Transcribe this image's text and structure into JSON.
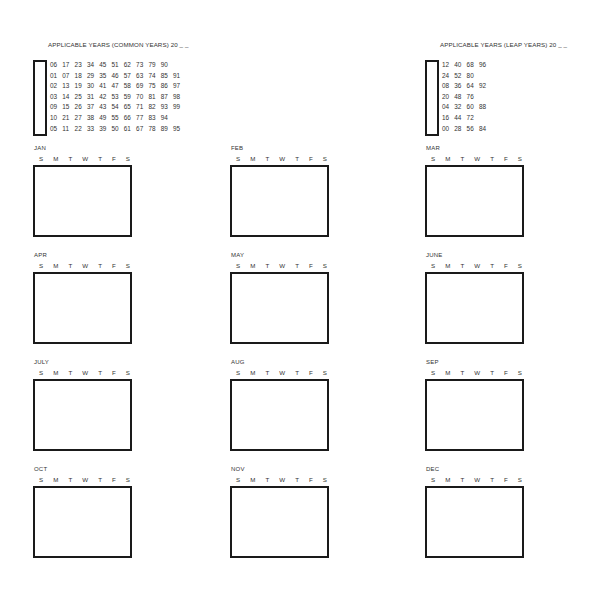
{
  "common_years": {
    "title": "APPLICABLE YEARS (COMMON YEARS) 20 _ _",
    "rows": [
      [
        "06",
        "17",
        "23",
        "34",
        "45",
        "51",
        "62",
        "73",
        "79",
        "90",
        ""
      ],
      [
        "01",
        "07",
        "18",
        "29",
        "35",
        "46",
        "57",
        "63",
        "74",
        "85",
        "91"
      ],
      [
        "02",
        "13",
        "19",
        "30",
        "41",
        "47",
        "58",
        "69",
        "75",
        "86",
        "97"
      ],
      [
        "03",
        "14",
        "25",
        "31",
        "42",
        "53",
        "59",
        "70",
        "81",
        "87",
        "98"
      ],
      [
        "09",
        "15",
        "26",
        "37",
        "43",
        "54",
        "65",
        "71",
        "82",
        "93",
        "99"
      ],
      [
        "10",
        "21",
        "27",
        "38",
        "49",
        "55",
        "66",
        "77",
        "83",
        "94",
        ""
      ],
      [
        "05",
        "11",
        "22",
        "33",
        "39",
        "50",
        "61",
        "67",
        "78",
        "89",
        "95"
      ]
    ]
  },
  "leap_years": {
    "title": "APPLICABLE YEARS (LEAP YEARS) 20 _ _",
    "rows": [
      [
        "12",
        "40",
        "68",
        "96"
      ],
      [
        "24",
        "52",
        "80",
        ""
      ],
      [
        "08",
        "36",
        "64",
        "92"
      ],
      [
        "20",
        "48",
        "76",
        ""
      ],
      [
        "04",
        "32",
        "60",
        "88"
      ],
      [
        "16",
        "44",
        "72",
        ""
      ],
      [
        "00",
        "28",
        "56",
        "84"
      ]
    ]
  },
  "weekdays": [
    "S",
    "M",
    "T",
    "W",
    "T",
    "F",
    "S"
  ],
  "months": [
    {
      "label": "JAN"
    },
    {
      "label": "FEB"
    },
    {
      "label": "MAR"
    },
    {
      "label": "APR"
    },
    {
      "label": "MAY"
    },
    {
      "label": "JUNE"
    },
    {
      "label": "JULY"
    },
    {
      "label": "AUG"
    },
    {
      "label": "SEP"
    },
    {
      "label": "OCT"
    },
    {
      "label": "NOV"
    },
    {
      "label": "DEC"
    }
  ]
}
